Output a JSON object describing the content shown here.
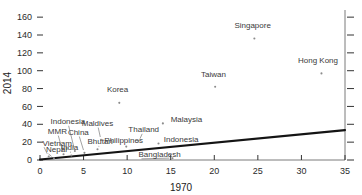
{
  "chart_data": {
    "type": "scatter",
    "title": "",
    "xlabel": "1970",
    "ylabel": "2014",
    "xlim": [
      0,
      35
    ],
    "ylim": [
      0,
      168
    ],
    "grid": false,
    "legend": "none",
    "xticks": [
      0,
      5,
      10,
      15,
      20,
      25,
      30,
      35
    ],
    "yticks": [
      0,
      20,
      40,
      60,
      80,
      100,
      120,
      140,
      160
    ],
    "xtick_labels": [
      "0",
      "5",
      "10",
      "15",
      "20",
      "25",
      "30",
      "35"
    ],
    "ytick_labels": [
      "0",
      "20",
      "40",
      "60",
      "80",
      "100",
      "120",
      "140",
      "160"
    ],
    "right_ticks": true,
    "points": [
      {
        "label": "Singapore",
        "x": 24.6,
        "y": 136.0,
        "label_x": 24.4,
        "label_y": 148.0,
        "anchor": "middle",
        "leader": false
      },
      {
        "label": "Hong Kong",
        "x": 32.3,
        "y": 97.0,
        "label_x": 31.9,
        "label_y": 108.5,
        "anchor": "middle",
        "leader": false
      },
      {
        "label": "Taiwan",
        "x": 20.1,
        "y": 82.0,
        "label_x": 19.9,
        "label_y": 93.5,
        "anchor": "middle",
        "leader": false
      },
      {
        "label": "Korea",
        "x": 9.1,
        "y": 64.0,
        "label_x": 8.9,
        "label_y": 76.0,
        "anchor": "middle",
        "leader": false
      },
      {
        "label": "Malaysia",
        "x": 14.1,
        "y": 41.0,
        "label_x": 15.0,
        "label_y": 42.5,
        "anchor": "start",
        "leader": false
      },
      {
        "label": "Maldives",
        "x": 7.0,
        "y": 22.5,
        "label_x": 6.6,
        "label_y": 38.0,
        "anchor": "middle",
        "leader": true
      },
      {
        "label": "Thailand",
        "x": 11.3,
        "y": 21.0,
        "label_x": 11.9,
        "label_y": 31.0,
        "anchor": "middle",
        "leader": true
      },
      {
        "label": "Indonesia",
        "x": 13.6,
        "y": 18.5,
        "label_x": 14.2,
        "label_y": 20.5,
        "anchor": "start",
        "leader": false
      },
      {
        "label": "Philippines",
        "x": 9.9,
        "y": 15.0,
        "label_x": 9.6,
        "label_y": 19.0,
        "anchor": "middle",
        "leader": false
      },
      {
        "label": "Bhutan",
        "x": 6.6,
        "y": 12.0,
        "label_x": 6.9,
        "label_y": 17.5,
        "anchor": "middle",
        "leader": true
      },
      {
        "label": "Indonesia",
        "x": 4.0,
        "y": 10.0,
        "label_x": 3.2,
        "label_y": 40.0,
        "anchor": "middle",
        "leader": true
      },
      {
        "label": "China",
        "x": 5.1,
        "y": 8.0,
        "label_x": 4.4,
        "label_y": 28.0,
        "anchor": "middle",
        "leader": true
      },
      {
        "label": "MMR",
        "x": 2.7,
        "y": 6.5,
        "label_x": 2.0,
        "label_y": 29.0,
        "anchor": "middle",
        "leader": true
      },
      {
        "label": "India",
        "x": 3.6,
        "y": 5.0,
        "label_x": 3.4,
        "label_y": 11.0,
        "anchor": "middle",
        "leader": true
      },
      {
        "label": "Vietnam",
        "x": 1.0,
        "y": 4.0,
        "label_x": 0.3,
        "label_y": 16.0,
        "anchor": "start",
        "leader": true
      },
      {
        "label": "Nepal",
        "x": 1.6,
        "y": 2.0,
        "label_x": 0.7,
        "label_y": 8.5,
        "anchor": "start",
        "leader": true
      },
      {
        "label": "Bangladesh",
        "x": 15.2,
        "y": 2.0,
        "label_x": 11.3,
        "label_y": 3.0,
        "anchor": "start",
        "leader": true
      }
    ],
    "trendline": {
      "x0": 0.0,
      "y0": 0.5,
      "x1": 35.0,
      "y1": 33.5
    }
  }
}
